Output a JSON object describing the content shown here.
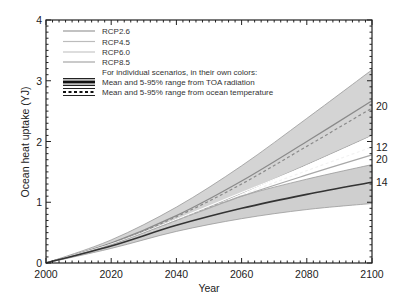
{
  "chart_data": {
    "type": "line",
    "title": "",
    "xlabel": "Year",
    "ylabel": "Ocean heat uptake (YJ)",
    "xlim": [
      2000,
      2100
    ],
    "ylim": [
      0,
      4
    ],
    "x_ticks": [
      2000,
      2020,
      2040,
      2060,
      2080,
      2100
    ],
    "y_ticks": [
      0,
      1,
      2,
      3,
      4
    ],
    "grid": false,
    "legend_position": "upper-left",
    "x": [
      2000,
      2020,
      2040,
      2060,
      2080,
      2100
    ],
    "bands": [
      {
        "name": "RCP8.5 5-95% range",
        "upper": [
          0,
          0.38,
          0.92,
          1.6,
          2.38,
          3.18
        ],
        "lower": [
          0,
          0.3,
          0.7,
          1.15,
          1.62,
          2.1
        ],
        "color": "#d4d4d4"
      },
      {
        "name": "RCP2.6 5-95% range",
        "upper": [
          0,
          0.32,
          0.72,
          1.1,
          1.38,
          1.62
        ],
        "lower": [
          0,
          0.24,
          0.52,
          0.73,
          0.88,
          0.98
        ],
        "color": "#cfcfcf"
      }
    ],
    "series": [
      {
        "name": "RCP8.5 mean (TOA radiation)",
        "values": [
          0,
          0.33,
          0.78,
          1.35,
          2.0,
          2.67
        ],
        "style": "solid",
        "color": "#8a8a8a"
      },
      {
        "name": "RCP8.5 mean (ocean temperature)",
        "values": [
          0,
          0.32,
          0.76,
          1.3,
          1.92,
          2.55
        ],
        "style": "dashed",
        "color": "#8a8a8a"
      },
      {
        "name": "RCP6.0 upper",
        "values": [
          0,
          0.31,
          0.72,
          1.16,
          1.6,
          2.08
        ],
        "style": "solid",
        "color": "#ffffff"
      },
      {
        "name": "RCP6.0 mean",
        "values": [
          0,
          0.3,
          0.7,
          1.12,
          1.52,
          1.91
        ],
        "style": "dashed",
        "color": "#f2f2f2"
      },
      {
        "name": "RCP4.5 mean",
        "values": [
          0,
          0.3,
          0.7,
          1.1,
          1.45,
          1.78
        ],
        "style": "solid",
        "color": "#a8a8a8"
      },
      {
        "name": "RCP2.6 mean (TOA radiation)",
        "values": [
          0,
          0.28,
          0.62,
          0.9,
          1.13,
          1.33
        ],
        "style": "solid",
        "color": "#333333"
      }
    ],
    "end_labels": [
      {
        "text": "20",
        "value": 2.6
      },
      {
        "text": "12",
        "value": 1.91
      },
      {
        "text": "20",
        "value": 1.72
      },
      {
        "text": "14",
        "value": 1.33
      }
    ]
  },
  "legend": {
    "items": [
      {
        "label": "RCP2.6",
        "kind": "thin",
        "color": "#9a9a9a"
      },
      {
        "label": "RCP4.5",
        "kind": "thin",
        "color": "#bcbcbc"
      },
      {
        "label": "RCP6.0",
        "kind": "thin",
        "color": "#c6c6c6"
      },
      {
        "label": "RCP8.5",
        "kind": "thin",
        "color": "#a6a6a6"
      },
      {
        "label": "For individual scenarios, in their own colors:",
        "kind": "none"
      },
      {
        "label": "Mean and 5-95% range from TOA radiation",
        "kind": "thick-band"
      },
      {
        "label": "Mean and 5-95% range from ocean temperature",
        "kind": "dashed-band"
      }
    ]
  },
  "axes": {
    "x_labels": [
      "2000",
      "2020",
      "2040",
      "2060",
      "2080",
      "2100"
    ],
    "y_labels": [
      "0",
      "1",
      "2",
      "3",
      "4"
    ],
    "xlabel": "Year",
    "ylabel": "Ocean heat uptake (YJ)"
  }
}
